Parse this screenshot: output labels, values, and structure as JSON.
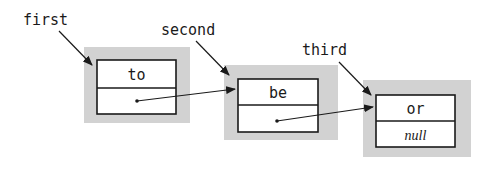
{
  "diagram": {
    "type": "linked-list",
    "colors": {
      "node_shadow": "#d2d2d2",
      "node_border": "#1a1a1a",
      "node_fill": "#ffffff",
      "arrow": "#1a1a1a",
      "text": "#1a1a1a"
    },
    "labels": [
      {
        "id": "first",
        "text": "first"
      },
      {
        "id": "second",
        "text": "second"
      },
      {
        "id": "third",
        "text": "third"
      }
    ],
    "nodes": [
      {
        "item": "to",
        "next": ""
      },
      {
        "item": "be",
        "next": ""
      },
      {
        "item": "or",
        "next": "null"
      }
    ]
  }
}
